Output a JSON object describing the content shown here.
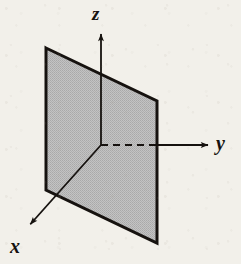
{
  "figure": {
    "kind": "3d-coordinate-plane-diagram",
    "width": 241,
    "height": 264,
    "background_color": "#f2f0ea",
    "ink_color": "#16120f",
    "plane_fill_color": "#b9b9b9",
    "plane_fill_pattern": "halftone-dots",
    "plane_outline_color": "#16120f"
  },
  "axes": [
    {
      "id": "z",
      "label": "z",
      "direction": "up",
      "origin": {
        "x": 101,
        "y": 145
      },
      "tip": {
        "x": 101,
        "y": 30
      },
      "label_position": {
        "x": 92,
        "y": 4
      },
      "style": "solid-with-arrowhead"
    },
    {
      "id": "y",
      "label": "y",
      "direction": "right",
      "origin": {
        "x": 101,
        "y": 145
      },
      "tip": {
        "x": 212,
        "y": 145
      },
      "label_position": {
        "x": 216,
        "y": 133
      },
      "style": "dashed-behind-plane-then-solid-with-arrowhead",
      "hidden_segment": {
        "from_x": 101,
        "to_x": 157
      },
      "visible_segment": {
        "from_x": 157,
        "to_x": 212
      }
    },
    {
      "id": "x",
      "label": "x",
      "direction": "down-left-toward-viewer",
      "origin": {
        "x": 101,
        "y": 145
      },
      "tip": {
        "x": 27,
        "y": 228
      },
      "label_position": {
        "x": 10,
        "y": 236
      },
      "style": "solid-with-arrowhead"
    }
  ],
  "plane": {
    "name": "xz-plane",
    "vertices": [
      {
        "x": 46,
        "y": 48
      },
      {
        "x": 157,
        "y": 101
      },
      {
        "x": 157,
        "y": 243
      },
      {
        "x": 46,
        "y": 190
      }
    ],
    "edges": [
      {
        "name": "top-edge",
        "from": 0,
        "to": 1
      },
      {
        "name": "right-edge",
        "from": 1,
        "to": 2
      },
      {
        "name": "bottom-edge",
        "from": 2,
        "to": 3
      },
      {
        "name": "left-edge",
        "from": 3,
        "to": 0
      }
    ],
    "outline_width": 3
  },
  "origin_point": {
    "x": 101,
    "y": 145,
    "label": ""
  }
}
